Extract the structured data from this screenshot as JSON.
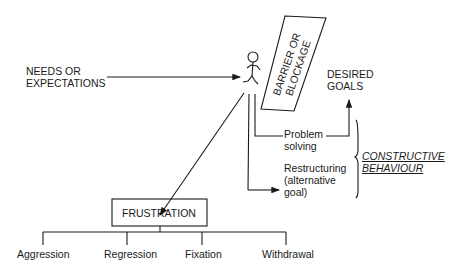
{
  "diagram": {
    "input": {
      "label": "NEEDS OR\nEXPECTATIONS"
    },
    "barrier": {
      "label_line1": "BARRIER OR",
      "label_line2": "BLOCKAGE"
    },
    "goal": {
      "label": "DESIRED\nGOALS"
    },
    "paths": {
      "problem_solving": "Problem\nsolving",
      "restructuring": "Restructuring\n(alternative\ngoal)"
    },
    "constructive": {
      "label": "CONSTRUCTIVE\nBEHAVIOUR"
    },
    "frustration": {
      "label": "FRUSTRATION",
      "outcomes": [
        "Aggression",
        "Regression",
        "Fixation",
        "Withdrawal"
      ]
    }
  }
}
